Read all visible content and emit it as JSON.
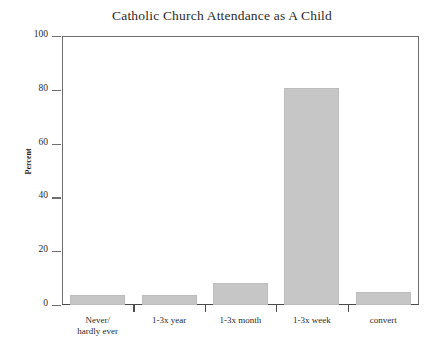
{
  "chart_data": {
    "type": "bar",
    "title": "Catholic Church Attendance as A Child",
    "xlabel": "",
    "ylabel": "Percent",
    "categories": [
      "Never/ hardly ever",
      "1-3x year",
      "1-3x month",
      "1-3x week",
      "convert"
    ],
    "category_lines": [
      [
        "Never/",
        "hardly ever"
      ],
      [
        "1-3x year"
      ],
      [
        "1-3x month"
      ],
      [
        "1-3x week"
      ],
      [
        "convert"
      ]
    ],
    "values": [
      3.7,
      3.7,
      8.0,
      80.5,
      5.0
    ],
    "ylim": [
      0,
      100
    ],
    "yticks": [
      0,
      20,
      40,
      60,
      80,
      100
    ],
    "ytick_labels": [
      "0",
      "20",
      "40",
      "60",
      "80",
      "100"
    ],
    "grid": false,
    "legend": null,
    "bar_color": "#c6c6c6",
    "axis_color": "#6e6e6e",
    "text_color": "#2b2b2b"
  }
}
